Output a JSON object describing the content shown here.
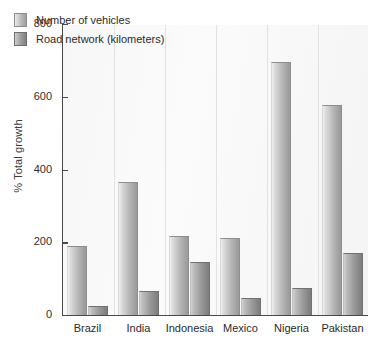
{
  "chart_data": {
    "type": "bar",
    "title": "",
    "xlabel": "",
    "ylabel": "% Total growth",
    "ylim": [
      0,
      800
    ],
    "yticks": [
      0,
      200,
      400,
      600,
      800
    ],
    "grid": false,
    "legend_position": "top-left",
    "categories": [
      "Brazil",
      "India",
      "Indonesia",
      "Mexico",
      "Nigeria",
      "Pakistan"
    ],
    "series": [
      {
        "name": "Number of vehicles",
        "values": [
          190,
          367,
          218,
          212,
          695,
          578
        ]
      },
      {
        "name": "Road network (kilometers)",
        "values": [
          25,
          65,
          145,
          48,
          75,
          170
        ]
      }
    ]
  },
  "axis": {
    "y_title": "% Total growth",
    "y_tick_labels": [
      "800",
      "600",
      "400",
      "200",
      "0"
    ]
  },
  "legend": {
    "items": [
      {
        "label": "Number of vehicles",
        "swatch": "vehicles"
      },
      {
        "label": "Road network (kilometers)",
        "swatch": "road"
      }
    ]
  },
  "colors": {
    "vehicles_bar": "#b8b8b8",
    "road_bar": "#9a9a9a",
    "axis": "#4a4a4a",
    "plot_background": "#f7f7f7",
    "text": "#2b2b2b"
  }
}
